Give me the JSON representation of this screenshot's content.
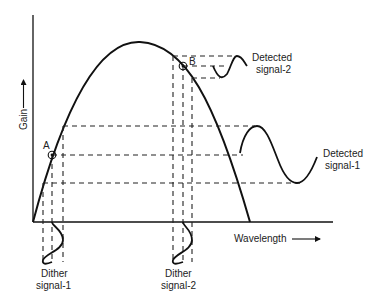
{
  "diagram": {
    "type": "wavelength-dither-gain-curve",
    "axes": {
      "y_label": "Gain",
      "x_label": "Wavelength"
    },
    "points": {
      "a": {
        "label": "A"
      },
      "b": {
        "label": "B"
      }
    },
    "labels": {
      "detected_signal_2": {
        "line1": "Detected",
        "line2": "signal-2"
      },
      "detected_signal_1": {
        "line1": "Detected",
        "line2": "signal-1"
      },
      "dither_signal_1": {
        "line1": "Dither",
        "line2": "signal-1"
      },
      "dither_signal_2": {
        "line1": "Dither",
        "line2": "signal-2"
      }
    },
    "colors": {
      "stroke": "#111111",
      "text": "#222222",
      "background": "#ffffff"
    }
  }
}
